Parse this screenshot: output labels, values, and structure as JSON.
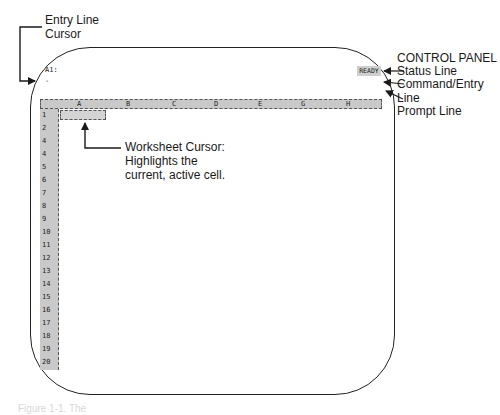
{
  "screen": {
    "cell_address": "A1:",
    "entry_cursor": "-",
    "mode_indicator": "READY",
    "columns": [
      "A",
      "B",
      "C",
      "D",
      "E",
      "G",
      "H"
    ],
    "rows": [
      "1",
      "2",
      "4",
      "4",
      "5",
      "6",
      "7",
      "8",
      "9",
      "10",
      "11",
      "12",
      "13",
      "14",
      "15",
      "16",
      "17",
      "18",
      "19",
      "20"
    ]
  },
  "callouts": {
    "entry_line_cursor": [
      "Entry Line",
      "Cursor"
    ],
    "control_panel_title": "CONTROL PANEL",
    "status_line": "Status Line",
    "command_entry_line": [
      "Command/Entry",
      "Line"
    ],
    "prompt_line": "Prompt Line",
    "worksheet_cursor": [
      "Worksheet Cursor:",
      "Highlights the",
      "current, active cell."
    ]
  },
  "caption": "Figure 1-1. The"
}
